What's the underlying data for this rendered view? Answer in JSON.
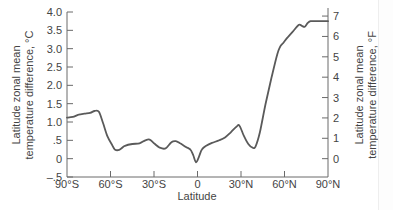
{
  "chart_data": {
    "type": "line",
    "title": "",
    "xlabel": "Latitude",
    "ylabel": "Latitude zonal mean temperature difference, °C",
    "ylabel_right": "Latitude zonal mean temperature difference, °F",
    "xlim": [
      -90,
      90
    ],
    "ylim": [
      -0.5,
      4.0
    ],
    "ylim_right_F": [
      -0.9,
      7.2
    ],
    "grid": false,
    "legend": "none",
    "x_ticks": [
      -90,
      -60,
      -30,
      0,
      30,
      60,
      90
    ],
    "x_tick_labels": [
      "90°S",
      "60°S",
      "30°S",
      "0",
      "30°N",
      "60°N",
      "90°N"
    ],
    "y_ticks": [
      4.0,
      3.5,
      3.0,
      2.5,
      2.0,
      1.5,
      1.0,
      0.5,
      0,
      -0.5
    ],
    "y_tick_labels": [
      "4.0",
      "3.5",
      "3.0",
      "2.5",
      "2.0",
      "1.5",
      "1.0",
      ".5",
      "0",
      "–.5"
    ],
    "y_right_ticks": [
      7,
      6,
      5,
      4,
      3,
      2,
      1,
      0
    ],
    "y_right_tick_labels": [
      "7",
      "6",
      "5",
      "4",
      "3",
      "2",
      "1",
      "0"
    ],
    "series": [
      {
        "name": "Zonal mean temperature difference",
        "color": "#5a5a5a",
        "x": [
          -90,
          -86,
          -82,
          -78,
          -74,
          -71,
          -68,
          -65,
          -62,
          -59,
          -57,
          -54,
          -50,
          -45,
          -40,
          -36,
          -33,
          -30,
          -26,
          -22,
          -18,
          -15,
          -12,
          -8,
          -5,
          -3,
          -1,
          1,
          3,
          6,
          10,
          15,
          19,
          23,
          27,
          29,
          32,
          35,
          38,
          40,
          43,
          47,
          51,
          55,
          57,
          59,
          62,
          66,
          70,
          72,
          74,
          76,
          78,
          82,
          86,
          90
        ],
        "values": [
          1.12,
          1.14,
          1.2,
          1.23,
          1.25,
          1.3,
          1.28,
          0.95,
          0.6,
          0.38,
          0.25,
          0.24,
          0.35,
          0.4,
          0.42,
          0.5,
          0.52,
          0.42,
          0.3,
          0.28,
          0.45,
          0.48,
          0.42,
          0.32,
          0.25,
          0.1,
          -0.1,
          0.05,
          0.25,
          0.35,
          0.43,
          0.5,
          0.58,
          0.72,
          0.88,
          0.9,
          0.62,
          0.4,
          0.3,
          0.33,
          0.72,
          1.5,
          2.2,
          2.85,
          3.05,
          3.15,
          3.3,
          3.48,
          3.65,
          3.62,
          3.6,
          3.7,
          3.75,
          3.75,
          3.75,
          3.75
        ]
      }
    ]
  },
  "axes": {
    "left_title_line1": "Latitude zonal mean",
    "left_title_line2": "temperature difference, °C",
    "right_title_line1": "Latitude zonal mean",
    "right_title_line2": "temperature difference, °F",
    "x_title": "Latitude"
  }
}
